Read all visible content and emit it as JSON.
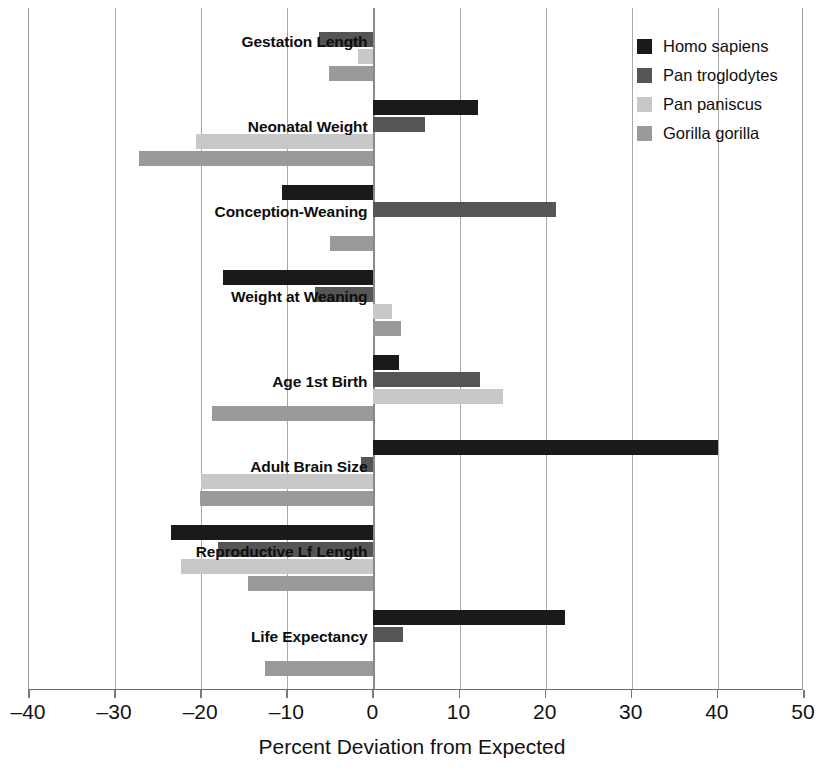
{
  "chart_data": {
    "type": "bar",
    "orientation": "horizontal",
    "title": "",
    "xlabel": "Percent Deviation from Expected",
    "ylabel": "",
    "xlim": [
      -40,
      50
    ],
    "xticks": [
      -40,
      -30,
      -20,
      -10,
      0,
      10,
      20,
      30,
      40,
      50
    ],
    "xtick_labels": [
      "–40",
      "–30",
      "–20",
      "–10",
      "0",
      "10",
      "20",
      "30",
      "40",
      "50"
    ],
    "grid": true,
    "grid_axis": "x",
    "legend_position": "top-right",
    "categories": [
      "Gestation Length",
      "Neonatal Weight",
      "Conception-Weaning",
      "Weight at Weaning",
      "Age 1st Birth",
      "Adult Brain Size",
      "Reproductive Lf Length",
      "Life Expectancy"
    ],
    "series": [
      {
        "name": "Homo sapiens",
        "color": "#1a1a1a",
        "values": [
          0,
          12.2,
          -10.6,
          -17.5,
          3.0,
          40.0,
          -23.5,
          22.2
        ]
      },
      {
        "name": "Pan troglodytes",
        "color": "#555555",
        "values": [
          -6.3,
          6.0,
          21.2,
          -6.8,
          12.4,
          -1.5,
          -18.0,
          3.4
        ]
      },
      {
        "name": "Pan paniscus",
        "color": "#c8c8c8",
        "values": [
          -1.8,
          -20.6,
          0,
          2.2,
          15.0,
          -20.0,
          -22.4,
          0
        ]
      },
      {
        "name": "Gorilla gorilla",
        "color": "#9a9a9a",
        "values": [
          -5.2,
          -27.2,
          -5.0,
          3.2,
          -18.8,
          -20.2,
          -14.6,
          -12.6
        ]
      }
    ]
  },
  "legend": {
    "items": [
      {
        "label": "Homo sapiens",
        "color": "#1a1a1a"
      },
      {
        "label": "Pan troglodytes",
        "color": "#555555"
      },
      {
        "label": "Pan paniscus",
        "color": "#c8c8c8"
      },
      {
        "label": "Gorilla gorilla",
        "color": "#9a9a9a"
      }
    ]
  },
  "axis": {
    "x_title": "Percent Deviation from Expected",
    "tick_labels": [
      "–40",
      "–30",
      "–20",
      "–10",
      "0",
      "10",
      "20",
      "30",
      "40",
      "50"
    ]
  }
}
